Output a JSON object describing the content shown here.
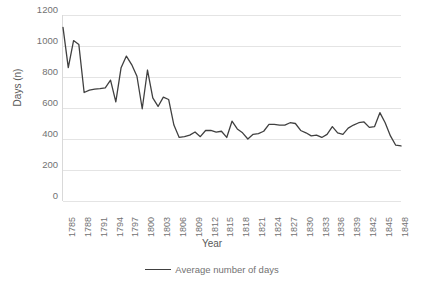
{
  "chart_data": {
    "type": "line",
    "title": "",
    "xlabel": "Year",
    "ylabel": "Days (n)",
    "ylim": [
      0,
      1200
    ],
    "ytick_step": 200,
    "yticks": [
      1200,
      1000,
      800,
      600,
      400,
      200,
      0
    ],
    "grid": true,
    "legend_position": "bottom",
    "xtick_labels": [
      "1785",
      "1788",
      "1791",
      "1794",
      "1797",
      "1800",
      "1803",
      "1806",
      "1809",
      "1812",
      "1815",
      "1818",
      "1821",
      "1824",
      "1827",
      "1830",
      "1833",
      "1836",
      "1839",
      "1842",
      "1845",
      "1848"
    ],
    "xtick_interval": 3,
    "x_start": 1785,
    "x_end": 1849,
    "line_color": "#404040",
    "grid_color": "#e4e4e4",
    "text_color": "#727272",
    "series": [
      {
        "name": "Average number of days",
        "x": [
          1785,
          1786,
          1787,
          1788,
          1789,
          1790,
          1791,
          1792,
          1793,
          1794,
          1795,
          1796,
          1797,
          1798,
          1799,
          1800,
          1801,
          1802,
          1803,
          1804,
          1805,
          1806,
          1807,
          1808,
          1809,
          1810,
          1811,
          1812,
          1813,
          1814,
          1815,
          1816,
          1817,
          1818,
          1819,
          1820,
          1821,
          1822,
          1823,
          1824,
          1825,
          1826,
          1827,
          1828,
          1829,
          1830,
          1831,
          1832,
          1833,
          1834,
          1835,
          1836,
          1837,
          1838,
          1839,
          1840,
          1841,
          1842,
          1843,
          1844,
          1845,
          1846,
          1847,
          1848,
          1849
        ],
        "values": [
          1120,
          860,
          1035,
          1010,
          700,
          715,
          722,
          725,
          730,
          780,
          640,
          860,
          935,
          880,
          805,
          595,
          845,
          665,
          610,
          670,
          655,
          490,
          410,
          415,
          425,
          445,
          415,
          455,
          455,
          445,
          450,
          410,
          515,
          465,
          440,
          400,
          430,
          435,
          450,
          495,
          495,
          490,
          490,
          505,
          500,
          455,
          440,
          420,
          425,
          410,
          430,
          480,
          440,
          430,
          470,
          490,
          505,
          510,
          475,
          480,
          570,
          505,
          420,
          360,
          355
        ]
      }
    ]
  },
  "legend": {
    "items": [
      {
        "label": "Average number of days",
        "color": "#404040"
      }
    ]
  }
}
